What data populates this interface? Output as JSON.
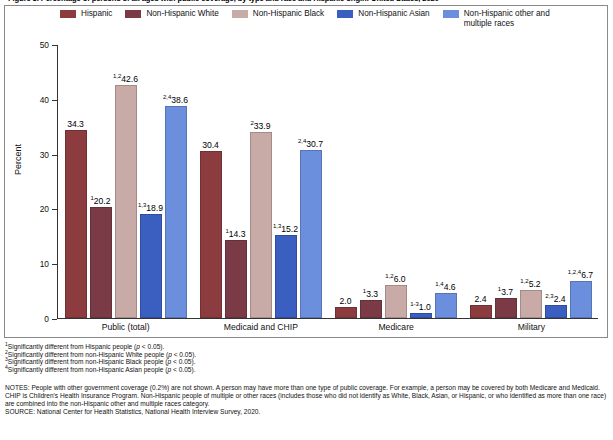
{
  "title": "Figure 3. Percentage of persons of all ages with public coverage, by type and race and Hispanic origin: United States, 2020",
  "legend": {
    "items": [
      {
        "label": "Hispanic",
        "color": "#8c3b3f"
      },
      {
        "label": "Non-Hispanic White",
        "color": "#7a3b46"
      },
      {
        "label": "Non-Hispanic Black",
        "color": "#c8aaa6"
      },
      {
        "label": "Non-Hispanic Asian",
        "color": "#3b5fc0"
      },
      {
        "label": "Non-Hispanic other and\nmultiple races",
        "color": "#6b8fdd"
      }
    ]
  },
  "axes": {
    "y_title": "Percent",
    "y_ticks": [
      "0",
      "10",
      "20",
      "30",
      "40",
      "50"
    ]
  },
  "footnotes": [
    {
      "sup": "1",
      "text": "Significantly different from Hispanic people (",
      "italic": "p",
      "tail": " < 0.05)."
    },
    {
      "sup": "2",
      "text": "Significantly different from non-Hispanic White people (",
      "italic": "p",
      "tail": " < 0.05)."
    },
    {
      "sup": "3",
      "text": "Significantly different from non-Hispanic Black people (",
      "italic": "p",
      "tail": " < 0.05)."
    },
    {
      "sup": "4",
      "text": "Significantly different from non-Hispanic Asian people (",
      "italic": "p",
      "tail": " < 0.05)."
    }
  ],
  "notes": "NOTES: People with other government coverage (0.2%) are not shown. A person may have more than one type of public coverage. For example, a person may be covered by both Medicare and Medicaid. CHIP is Children's Health Insurance Program. Non-Hispanic people of multiple or other races (includes those who did not identify as White, Black, Asian, or Hispanic, or who identified as more than one race) are combined into the non-Hispanic other and multiple races category.",
  "source": "SOURCE: National Center for Health Statistics, National Health Interview Survey, 2020.",
  "chart_data": {
    "type": "bar",
    "title": "Figure 3. Percentage of persons of all ages with public coverage, by type and race and Hispanic origin: United States, 2020",
    "xlabel": "",
    "ylabel": "Percent",
    "ylim": [
      0,
      50
    ],
    "yticks": [
      0,
      10,
      20,
      30,
      40,
      50
    ],
    "grid": false,
    "legend_position": "top",
    "categories": [
      "Public (total)",
      "Medicaid and CHIP",
      "Medicare",
      "Military"
    ],
    "series": [
      {
        "name": "Hispanic",
        "color": "#8c3b3f",
        "values": [
          34.3,
          30.4,
          2.0,
          2.4
        ],
        "labels": [
          "34.3",
          "30.4",
          "2.0",
          "2.4"
        ],
        "superscripts": [
          "",
          "",
          "",
          ""
        ]
      },
      {
        "name": "Non-Hispanic White",
        "color": "#7a3b46",
        "values": [
          20.2,
          14.3,
          3.3,
          3.7
        ],
        "labels": [
          "20.2",
          "14.3",
          "3.3",
          "3.7"
        ],
        "superscripts": [
          "1",
          "1",
          "1",
          "1"
        ]
      },
      {
        "name": "Non-Hispanic Black",
        "color": "#c8aaa6",
        "values": [
          42.6,
          33.9,
          6.0,
          5.2
        ],
        "labels": [
          "42.6",
          "33.9",
          "6.0",
          "5.2"
        ],
        "superscripts": [
          "1,2",
          "2",
          "1,2",
          "1,2"
        ]
      },
      {
        "name": "Non-Hispanic Asian",
        "color": "#3b5fc0",
        "values": [
          18.9,
          15.2,
          1.0,
          2.4
        ],
        "labels": [
          "18.9",
          "15.2",
          "1.0",
          "2.4"
        ],
        "superscripts": [
          "1,3",
          "1,3",
          "1-3",
          "2,3"
        ]
      },
      {
        "name": "Non-Hispanic other and multiple races",
        "color": "#6b8fdd",
        "values": [
          38.6,
          30.7,
          4.6,
          6.7
        ],
        "labels": [
          "38.6",
          "30.7",
          "4.6",
          "6.7"
        ],
        "superscripts": [
          "2,4",
          "2,4",
          "1,4",
          "1,2,4"
        ]
      }
    ]
  }
}
